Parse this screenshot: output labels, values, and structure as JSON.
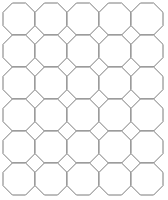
{
  "diagram": {
    "type": "octagon-square-tiling",
    "columns": 5,
    "rows": 6,
    "origin": [
      3,
      3
    ],
    "pitch": 32,
    "octagon_size": 32,
    "corner_cut": 9.4,
    "stroke_color": "#7a7a7a",
    "stroke_width": 1,
    "fill_color": "#ffffff",
    "background": "#ffffff"
  }
}
